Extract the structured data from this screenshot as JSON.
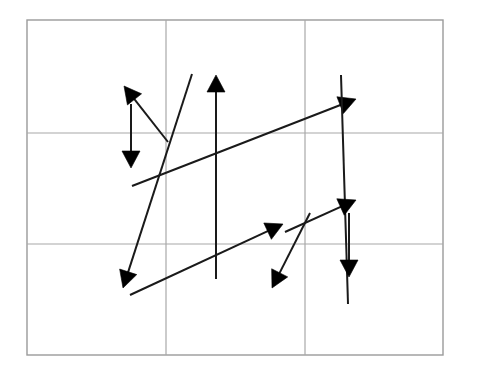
{
  "canvas": {
    "width": 478,
    "height": 378,
    "background_color": "#ffffff",
    "title": "Arrow grid figure"
  },
  "figure": {
    "type": "line-and-arrow-diagram",
    "frame": {
      "x": 27,
      "y": 20,
      "width": 416,
      "height": 335,
      "stroke_color": "#9a9a9a",
      "stroke_width": 1.4
    },
    "grid": {
      "stroke_color": "#a8a8a8",
      "stroke_width": 1.2,
      "vertical_lines_x": [
        166,
        305
      ],
      "horizontal_lines_y": [
        133,
        244
      ],
      "columns": 3,
      "rows": 3
    },
    "arrow_style": {
      "stroke_color": "#1a1a1a",
      "stroke_width": 2.0,
      "head_color": "#000000",
      "head_length": 17,
      "head_half_width": 9
    },
    "arrows": [
      {
        "name": "arrow-up-left-short",
        "from_x": 168,
        "from_y": 142,
        "to_x": 124,
        "to_y": 86,
        "has_head": true,
        "direction": "up-left"
      },
      {
        "name": "arrow-down-vertical-left",
        "from_x": 131,
        "from_y": 104,
        "to_x": 131,
        "to_y": 168,
        "has_head": true,
        "direction": "down"
      },
      {
        "name": "arrow-up-vertical-long-center",
        "from_x": 216,
        "from_y": 279,
        "to_x": 216,
        "to_y": 75,
        "has_head": true,
        "direction": "up"
      },
      {
        "name": "arrow-down-left-steep-long",
        "from_x": 192,
        "from_y": 74,
        "to_x": 123,
        "to_y": 288,
        "has_head": true,
        "direction": "down-left"
      },
      {
        "name": "line-diagonal-upper-right-long",
        "from_x": 132,
        "from_y": 186,
        "to_x": 356,
        "to_y": 99,
        "has_head": true,
        "direction": "up-right"
      },
      {
        "name": "line-steep-down-right",
        "from_x": 341,
        "from_y": 75,
        "to_x": 348,
        "to_y": 304,
        "has_head": false,
        "direction": "down-right"
      },
      {
        "name": "arrow-up-right-lower",
        "from_x": 130,
        "from_y": 295,
        "to_x": 283,
        "to_y": 224,
        "has_head": true,
        "direction": "up-right"
      },
      {
        "name": "arrow-down-left-lower-short",
        "from_x": 310,
        "from_y": 213,
        "to_x": 272,
        "to_y": 288,
        "has_head": true,
        "direction": "down-left"
      },
      {
        "name": "arrow-up-right-short-right",
        "from_x": 285,
        "from_y": 232,
        "to_x": 356,
        "to_y": 200,
        "has_head": true,
        "direction": "up-right"
      },
      {
        "name": "arrow-down-vertical-right",
        "from_x": 349,
        "from_y": 213,
        "to_x": 349,
        "to_y": 277,
        "has_head": true,
        "direction": "down"
      }
    ]
  }
}
